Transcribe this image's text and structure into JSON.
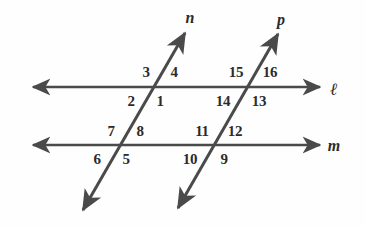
{
  "figure": {
    "stroke_color": "#4a4a4a",
    "text_color": "#2b2b2b",
    "background_color": "#fefefe"
  },
  "lines": [
    {
      "name": "line-l",
      "label": "ℓ",
      "label_x": 334,
      "label_y": 89,
      "kind": "horizontal",
      "x1": 33,
      "y1": 87,
      "x2": 320,
      "y2": 87,
      "arrow_start": true,
      "arrow_end": true
    },
    {
      "name": "line-m",
      "label": "m",
      "label_x": 334,
      "label_y": 146,
      "kind": "horizontal",
      "x1": 33,
      "y1": 145,
      "x2": 320,
      "y2": 145,
      "arrow_start": true,
      "arrow_end": true
    },
    {
      "name": "line-n",
      "label": "n",
      "label_x": 190,
      "label_y": 18,
      "kind": "transversal",
      "x1": 83,
      "y1": 210,
      "x2": 185,
      "y2": 33,
      "arrow_start": true,
      "arrow_end": true
    },
    {
      "name": "line-p",
      "label": "p",
      "label_x": 281,
      "label_y": 20,
      "kind": "transversal",
      "x1": 178,
      "y1": 208,
      "x2": 278,
      "y2": 34,
      "arrow_start": true,
      "arrow_end": true
    }
  ],
  "intersections": [
    {
      "name": "n-meets-l",
      "x": 152,
      "y": 87
    },
    {
      "name": "p-meets-l",
      "x": 247,
      "y": 87
    },
    {
      "name": "n-meets-m",
      "x": 118,
      "y": 145
    },
    {
      "name": "p-meets-m",
      "x": 213,
      "y": 145
    }
  ],
  "angle_labels": [
    {
      "id": "angle-1",
      "text": "1",
      "x": 160,
      "y": 101,
      "intersection": "n-meets-l",
      "position": "below-right"
    },
    {
      "id": "angle-2",
      "text": "2",
      "x": 131,
      "y": 101,
      "intersection": "n-meets-l",
      "position": "below-left"
    },
    {
      "id": "angle-3",
      "text": "3",
      "x": 146,
      "y": 72,
      "intersection": "n-meets-l",
      "position": "above-left"
    },
    {
      "id": "angle-4",
      "text": "4",
      "x": 174,
      "y": 72,
      "intersection": "n-meets-l",
      "position": "above-right"
    },
    {
      "id": "angle-5",
      "text": "5",
      "x": 126,
      "y": 159,
      "intersection": "n-meets-m",
      "position": "below-right"
    },
    {
      "id": "angle-6",
      "text": "6",
      "x": 97,
      "y": 159,
      "intersection": "n-meets-m",
      "position": "below-left"
    },
    {
      "id": "angle-7",
      "text": "7",
      "x": 111,
      "y": 131,
      "intersection": "n-meets-m",
      "position": "above-left"
    },
    {
      "id": "angle-8",
      "text": "8",
      "x": 140,
      "y": 131,
      "intersection": "n-meets-m",
      "position": "above-right"
    },
    {
      "id": "angle-9",
      "text": "9",
      "x": 224,
      "y": 159,
      "intersection": "p-meets-m",
      "position": "below-right"
    },
    {
      "id": "angle-10",
      "text": "10",
      "x": 190,
      "y": 159,
      "intersection": "p-meets-m",
      "position": "below-left"
    },
    {
      "id": "angle-11",
      "text": "11",
      "x": 202,
      "y": 131,
      "intersection": "p-meets-m",
      "position": "above-left"
    },
    {
      "id": "angle-12",
      "text": "12",
      "x": 235,
      "y": 131,
      "intersection": "p-meets-m",
      "position": "above-right"
    },
    {
      "id": "angle-13",
      "text": "13",
      "x": 259,
      "y": 101,
      "intersection": "p-meets-l",
      "position": "below-right"
    },
    {
      "id": "angle-14",
      "text": "14",
      "x": 223,
      "y": 101,
      "intersection": "p-meets-l",
      "position": "below-left"
    },
    {
      "id": "angle-15",
      "text": "15",
      "x": 236,
      "y": 72,
      "intersection": "p-meets-l",
      "position": "above-left"
    },
    {
      "id": "angle-16",
      "text": "16",
      "x": 270,
      "y": 72,
      "intersection": "p-meets-l",
      "position": "above-right"
    }
  ]
}
